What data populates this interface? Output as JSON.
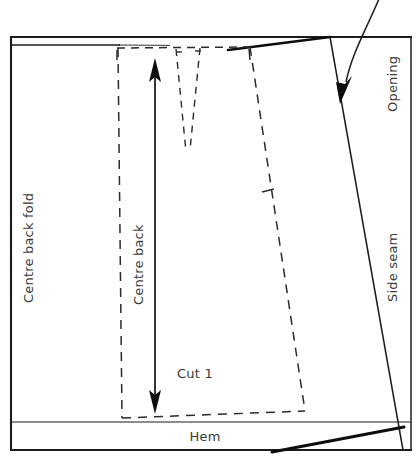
{
  "diagram": {
    "kind": "sewing-pattern-cutting-layout",
    "labels": {
      "centre_back_fold": "Centre back fold",
      "centre_back": "Centre back",
      "cut_quantity": "Cut 1",
      "hem": "Hem",
      "side_seam": "Side seam",
      "opening": "Opening"
    },
    "colors": {
      "ink": "#1c1c1c",
      "label_ink": "#3a3a3a",
      "pattern_ink": "#2b2b2b",
      "paper": "#ffffff"
    },
    "line_styles": {
      "fabric_edge": "solid",
      "pattern_piece": "dashed",
      "grainline": "double-headed-arrow"
    },
    "elements": {
      "fabric_rectangle": "fabric-outline",
      "pattern_piece": "skirt-back-pattern-outline",
      "dart": "waist-dart",
      "grainline_arrow": "centre-back-grainline",
      "notch": "side-seam-notch",
      "opening_leader": "opening-callout-arrow",
      "hem_band": "hem-allowance-band"
    }
  }
}
